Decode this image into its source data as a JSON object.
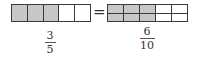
{
  "left_model": {
    "parts": 5,
    "shaded": 3,
    "fraction": {
      "numerator": "3",
      "denominator": "5"
    }
  },
  "equals_sign": "=",
  "right_model": {
    "columns": 5,
    "rows": 2,
    "shaded_columns": 3,
    "fraction": {
      "numerator": "6",
      "denominator": "10"
    }
  },
  "colors": {
    "shaded": "#c8c8c8",
    "unshaded": "#ffffff",
    "border": "#3a3a3a"
  }
}
